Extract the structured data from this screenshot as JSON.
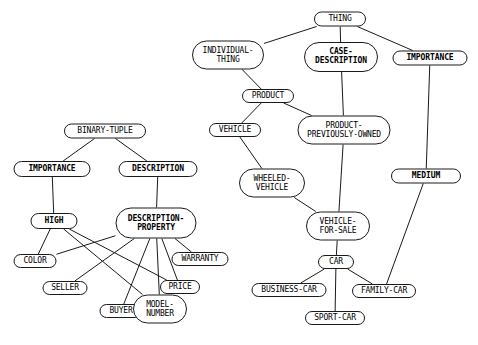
{
  "diagram": {
    "background_color": "#ffffff",
    "line_color": "#1a1a1a",
    "text_color": "#000000",
    "nodes": [
      {
        "id": "thing",
        "label": "THING",
        "x": 340,
        "y": 19,
        "w": 52,
        "h": 15,
        "bold": false
      },
      {
        "id": "individual-thing",
        "label": "INDIVIDUAL-\nTHING",
        "x": 228,
        "y": 55,
        "w": 72,
        "h": 29,
        "bold": false
      },
      {
        "id": "case-description",
        "label": "CASE-\nDESCRIPTION",
        "x": 341,
        "y": 57,
        "w": 74,
        "h": 30,
        "bold": true
      },
      {
        "id": "importance-right",
        "label": "IMPORTANCE",
        "x": 430,
        "y": 58,
        "w": 75,
        "h": 15,
        "bold": true
      },
      {
        "id": "product",
        "label": "PRODUCT",
        "x": 268,
        "y": 96,
        "w": 52,
        "h": 14,
        "bold": false
      },
      {
        "id": "binary-tuple",
        "label": "BINARY-TUPLE",
        "x": 105,
        "y": 131,
        "w": 82,
        "h": 15,
        "bold": false
      },
      {
        "id": "product-prev",
        "label": "PRODUCT-\nPREVIOUSLY-OWNED",
        "x": 344,
        "y": 130,
        "w": 93,
        "h": 29,
        "bold": false
      },
      {
        "id": "vehicle",
        "label": "VEHICLE",
        "x": 235,
        "y": 130,
        "w": 52,
        "h": 14,
        "bold": false
      },
      {
        "id": "importance-left",
        "label": "IMPORTANCE",
        "x": 52,
        "y": 169,
        "w": 77,
        "h": 16,
        "bold": true
      },
      {
        "id": "description",
        "label": "DESCRIPTION",
        "x": 158,
        "y": 169,
        "w": 79,
        "h": 16,
        "bold": true
      },
      {
        "id": "medium",
        "label": "MEDIUM",
        "x": 426,
        "y": 176,
        "w": 70,
        "h": 15,
        "bold": true
      },
      {
        "id": "wheeled-vehicle",
        "label": "WHEELED-\nVEHICLE",
        "x": 272,
        "y": 183,
        "w": 66,
        "h": 29,
        "bold": false
      },
      {
        "id": "high",
        "label": "HIGH",
        "x": 54,
        "y": 221,
        "w": 47,
        "h": 16,
        "bold": true
      },
      {
        "id": "desc-property",
        "label": "DESCRIPTION-\nPROPERTY",
        "x": 156,
        "y": 223,
        "w": 81,
        "h": 31,
        "bold": true
      },
      {
        "id": "vehicle-for-sale",
        "label": "VEHICLE-\nFOR-SALE",
        "x": 338,
        "y": 226,
        "w": 64,
        "h": 29,
        "bold": false
      },
      {
        "id": "color",
        "label": "COLOR",
        "x": 35,
        "y": 261,
        "w": 43,
        "h": 14,
        "bold": false
      },
      {
        "id": "warranty",
        "label": "WARRANTY",
        "x": 200,
        "y": 259,
        "w": 57,
        "h": 14,
        "bold": false
      },
      {
        "id": "car",
        "label": "CAR",
        "x": 336,
        "y": 262,
        "w": 36,
        "h": 14,
        "bold": false
      },
      {
        "id": "seller",
        "label": "SELLER",
        "x": 65,
        "y": 288,
        "w": 45,
        "h": 14,
        "bold": false
      },
      {
        "id": "price",
        "label": "PRICE",
        "x": 180,
        "y": 287,
        "w": 40,
        "h": 14,
        "bold": false
      },
      {
        "id": "business-car",
        "label": "BUSINESS-CAR",
        "x": 289,
        "y": 290,
        "w": 75,
        "h": 14,
        "bold": false
      },
      {
        "id": "family-car",
        "label": "FAMILY-CAR",
        "x": 384,
        "y": 291,
        "w": 64,
        "h": 14,
        "bold": false
      },
      {
        "id": "buyer",
        "label": "BUYER",
        "x": 121,
        "y": 311,
        "w": 43,
        "h": 14,
        "bold": false
      },
      {
        "id": "model-number",
        "label": "MODEL-\nNUMBER",
        "x": 160,
        "y": 309,
        "w": 54,
        "h": 29,
        "bold": false
      },
      {
        "id": "sport-car",
        "label": "SPORT-CAR",
        "x": 335,
        "y": 318,
        "w": 60,
        "h": 14,
        "bold": false
      }
    ],
    "edges": [
      {
        "from": "thing",
        "to": "individual-thing"
      },
      {
        "from": "thing",
        "to": "case-description"
      },
      {
        "from": "thing",
        "to": "importance-right"
      },
      {
        "from": "individual-thing",
        "to": "product"
      },
      {
        "from": "product",
        "to": "vehicle"
      },
      {
        "from": "product",
        "to": "product-prev"
      },
      {
        "from": "case-description",
        "to": "product-prev"
      },
      {
        "from": "product-prev",
        "to": "vehicle-for-sale"
      },
      {
        "from": "vehicle",
        "to": "wheeled-vehicle"
      },
      {
        "from": "wheeled-vehicle",
        "to": "vehicle-for-sale"
      },
      {
        "from": "vehicle-for-sale",
        "to": "car"
      },
      {
        "from": "car",
        "to": "business-car"
      },
      {
        "from": "car",
        "to": "family-car"
      },
      {
        "from": "car",
        "to": "sport-car"
      },
      {
        "from": "importance-right",
        "to": "medium"
      },
      {
        "from": "medium",
        "to": "family-car"
      },
      {
        "from": "binary-tuple",
        "to": "importance-left"
      },
      {
        "from": "binary-tuple",
        "to": "description"
      },
      {
        "from": "importance-left",
        "to": "high"
      },
      {
        "from": "description",
        "to": "desc-property"
      },
      {
        "from": "high",
        "to": "color"
      },
      {
        "from": "high",
        "to": "model-number"
      },
      {
        "from": "high",
        "to": "price"
      },
      {
        "from": "desc-property",
        "to": "color"
      },
      {
        "from": "desc-property",
        "to": "seller"
      },
      {
        "from": "desc-property",
        "to": "buyer"
      },
      {
        "from": "desc-property",
        "to": "model-number"
      },
      {
        "from": "desc-property",
        "to": "price"
      },
      {
        "from": "desc-property",
        "to": "warranty"
      }
    ]
  }
}
